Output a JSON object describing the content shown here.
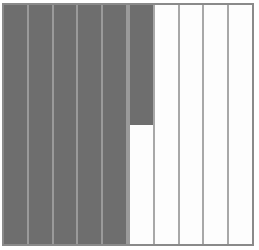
{
  "diagram": {
    "total_parts": 10,
    "shaded_full": 5,
    "partial_strip_fraction": 0.5,
    "shaded_fraction": "55/100",
    "shaded_color": "#6e6e6e",
    "unshaded_color": "#fdfdfd",
    "divider_color": "#a8a8a8"
  }
}
